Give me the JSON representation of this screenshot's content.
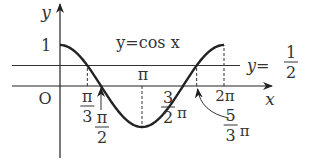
{
  "chart_data": {
    "type": "line",
    "title": "",
    "function": "cos",
    "x_range": [
      0,
      6.2832
    ],
    "ylim": [
      -1,
      1
    ],
    "xlabel": "x",
    "ylabel": "y",
    "origin_label": "O",
    "y_tick_one": "1",
    "curve_label": "y=cos x",
    "hline": {
      "value": 0.5,
      "label_prefix": "y=",
      "label_num": "1",
      "label_den": "2"
    },
    "dashed_x": [
      1.0472,
      3.1416,
      5.236,
      6.2832
    ],
    "x_marks": [
      {
        "name": "pi-over-3",
        "value": 1.0472,
        "num": "π",
        "den": "3",
        "suffix": ""
      },
      {
        "name": "pi-over-2",
        "value": 1.5708,
        "num": "π",
        "den": "2",
        "suffix": ""
      },
      {
        "name": "pi",
        "value": 3.1416,
        "text": "π"
      },
      {
        "name": "three-halves-pi",
        "value": 4.7124,
        "num": "3",
        "den": "2",
        "suffix": "π"
      },
      {
        "name": "five-thirds-pi",
        "value": 5.236,
        "num": "5",
        "den": "3",
        "suffix": "π"
      },
      {
        "name": "two-pi",
        "value": 6.2832,
        "text": "2π"
      }
    ],
    "grid": false,
    "color": "#222222"
  }
}
